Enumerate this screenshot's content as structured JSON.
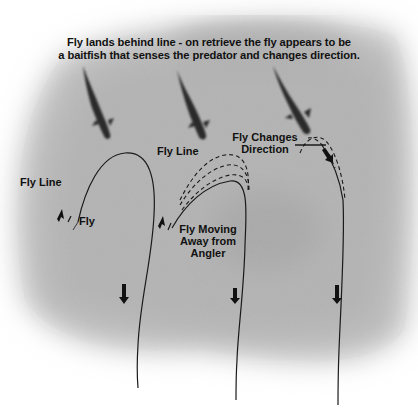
{
  "caption": {
    "line1": "Fly lands behind line - on retrieve the fly appears to be",
    "line2": "a baitfish that senses the predator and changes direction."
  },
  "panels": [
    {
      "id": "panel-1",
      "labels": {
        "fly_line": "Fly Line",
        "fly": "Fly"
      },
      "icons": [
        "fish-icon",
        "arrow-up-icon",
        "arrow-down-icon"
      ]
    },
    {
      "id": "panel-2",
      "labels": {
        "fly_line": "Fly Line",
        "fly_moving_1": "Fly Moving",
        "fly_moving_2": "Away from",
        "fly_moving_3": "Angler"
      },
      "icons": [
        "fish-icon",
        "arrow-up-icon",
        "arrow-down-icon"
      ]
    },
    {
      "id": "panel-3",
      "labels": {
        "changes_1": "Fly Changes",
        "changes_2": "Direction"
      },
      "icons": [
        "fish-icon",
        "arrow-diagonal-icon",
        "arrow-down-icon"
      ]
    }
  ],
  "colors": {
    "background_wash": "#b9b9b9",
    "line": "#1a1a1a",
    "fish": "#2a2a2a",
    "text": "#111111"
  }
}
